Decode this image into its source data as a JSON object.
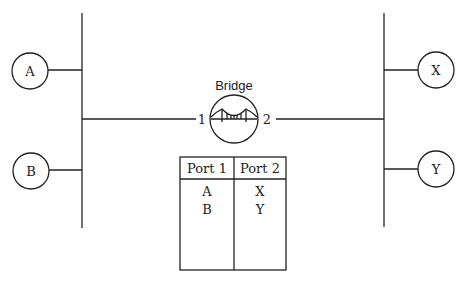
{
  "diagram": {
    "bridge": {
      "label": "Bridge",
      "port1": "1",
      "port2": "2"
    },
    "left_nodes": [
      {
        "label": "A"
      },
      {
        "label": "B"
      }
    ],
    "right_nodes": [
      {
        "label": "X"
      },
      {
        "label": "Y"
      }
    ],
    "table": {
      "headers": [
        "Port 1",
        "Port 2"
      ],
      "rows": [
        [
          "A",
          "X"
        ],
        [
          "B",
          "Y"
        ]
      ]
    }
  }
}
